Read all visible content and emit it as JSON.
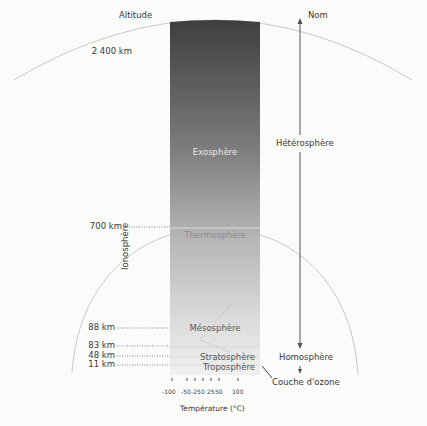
{
  "header": {
    "altitude_label": "Altitude",
    "name_label": "Nom"
  },
  "altitudes": [
    {
      "label": "2 400 km"
    },
    {
      "label": "700 km"
    },
    {
      "label": "88 km"
    },
    {
      "label": "83 km"
    },
    {
      "label": "48 km"
    },
    {
      "label": "11 km"
    }
  ],
  "layers": [
    {
      "name": "Exosphère"
    },
    {
      "name": "Thermosphère"
    },
    {
      "name": "Mésosphère"
    },
    {
      "name": "Stratosphère"
    },
    {
      "name": "Troposphère"
    }
  ],
  "side_labels": {
    "ionosphere": "Ionosphère",
    "heterosphere": "Hétérosphère",
    "homosphere": "Homosphère",
    "ozone_layer": "Couche d'ozone"
  },
  "temperature_axis": {
    "ticks": [
      "-100",
      "-50",
      "-25",
      "0",
      "25",
      "50",
      "100"
    ],
    "label": "Température (°C)"
  },
  "colors": {
    "column_top": "#3f3f3f",
    "column_bottom": "#f0f0ef",
    "arc": "#c9c9c9",
    "arrow": "#555555"
  }
}
